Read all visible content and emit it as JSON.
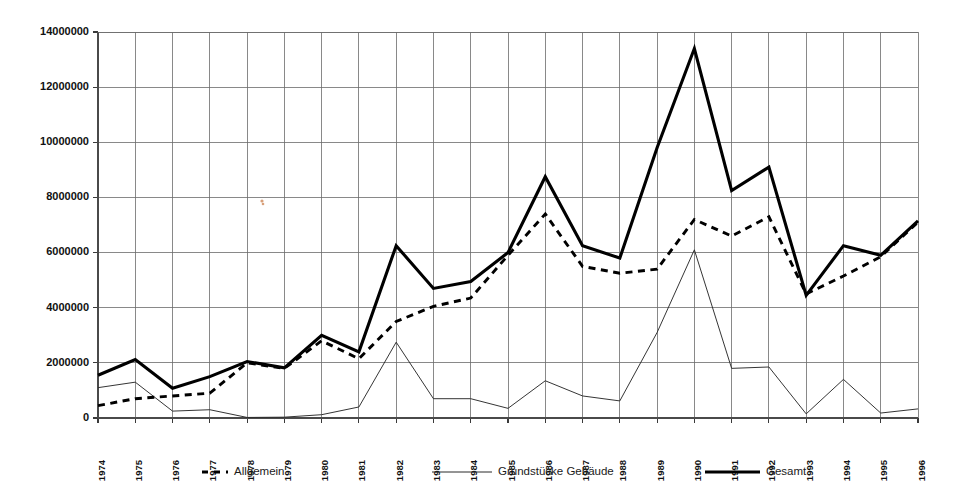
{
  "chart_data": {
    "type": "line",
    "title": "",
    "xlabel": "",
    "ylabel": "",
    "grid": true,
    "legend_position": "bottom",
    "ylim": [
      0,
      14000000
    ],
    "ytick_values": [
      0,
      2000000,
      4000000,
      6000000,
      8000000,
      10000000,
      12000000,
      14000000
    ],
    "ytick_labels": [
      "0",
      "2000000",
      "4000000",
      "6000000",
      "8000000",
      "10000000",
      "12000000",
      "14000000"
    ],
    "categories": [
      "1974",
      "1975",
      "1976",
      "1977",
      "1978",
      "1979",
      "1980",
      "1981",
      "1982",
      "1983",
      "1984",
      "1985",
      "1986",
      "1987",
      "1988",
      "1989",
      "1990",
      "1991",
      "1992",
      "1993",
      "1994",
      "1995",
      "1996"
    ],
    "series": [
      {
        "name": "Allgemein",
        "style": "dashed",
        "values": [
          450000,
          700000,
          800000,
          900000,
          2000000,
          1800000,
          2800000,
          2150000,
          3500000,
          4050000,
          4350000,
          5900000,
          7400000,
          5500000,
          5250000,
          5400000,
          7200000,
          6600000,
          7300000,
          4500000,
          5150000,
          5850000,
          7100000
        ]
      },
      {
        "name": "Grundstücke Gebäude",
        "style": "thin-solid",
        "values": [
          1100000,
          1300000,
          250000,
          300000,
          20000,
          30000,
          120000,
          400000,
          2750000,
          700000,
          700000,
          350000,
          1350000,
          800000,
          620000,
          3100000,
          6100000,
          1800000,
          1850000,
          150000,
          1400000,
          180000,
          330000
        ]
      },
      {
        "name": "Gesamt",
        "style": "thick-solid",
        "values": [
          1550000,
          2120000,
          1080000,
          1500000,
          2050000,
          1820000,
          3000000,
          2400000,
          6250000,
          4700000,
          4950000,
          6000000,
          8750000,
          6250000,
          5800000,
          9800000,
          13400000,
          8250000,
          9100000,
          4450000,
          6250000,
          5900000,
          7150000
        ]
      }
    ]
  },
  "legend": {
    "items": [
      {
        "label": "Allgemein",
        "marker": "dashed-line"
      },
      {
        "label": "Grundstücke Gebäude",
        "marker": "thin-line"
      },
      {
        "label": "Gesamt",
        "marker": "thick-line"
      }
    ]
  }
}
